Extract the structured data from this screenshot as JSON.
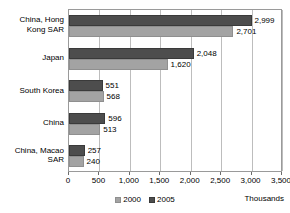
{
  "chart_data": {
    "type": "bar",
    "orientation": "horizontal",
    "title": "",
    "xlabel": "Thousands",
    "ylabel": "",
    "xlim": [
      0,
      3500
    ],
    "xticks": [
      "0",
      "500",
      "1,000",
      "1,500",
      "2,000",
      "2,500",
      "3,000",
      "3,500"
    ],
    "xtick_values": [
      0,
      500,
      1000,
      1500,
      2000,
      2500,
      3000,
      3500
    ],
    "grid": true,
    "legend_position": "bottom",
    "categories": [
      "China, Hong\nKong SAR",
      "Japan",
      "South Korea",
      "China",
      "China, Macao\nSAR"
    ],
    "series": [
      {
        "name": "2005",
        "color": "#4d4d4d",
        "values": [
          2999,
          2048,
          551,
          596,
          257
        ],
        "labels": [
          "2,999",
          "2,048",
          "551",
          "596",
          "257"
        ]
      },
      {
        "name": "2000",
        "color": "#a3a3a3",
        "values": [
          2701,
          1620,
          568,
          513,
          240
        ],
        "labels": [
          "2,701",
          "1,620",
          "568",
          "513",
          "240"
        ]
      }
    ]
  },
  "legend": {
    "items": [
      {
        "label": "2000",
        "color": "#a3a3a3"
      },
      {
        "label": "2005",
        "color": "#4d4d4d"
      }
    ]
  },
  "units": {
    "label": "Thousands"
  }
}
